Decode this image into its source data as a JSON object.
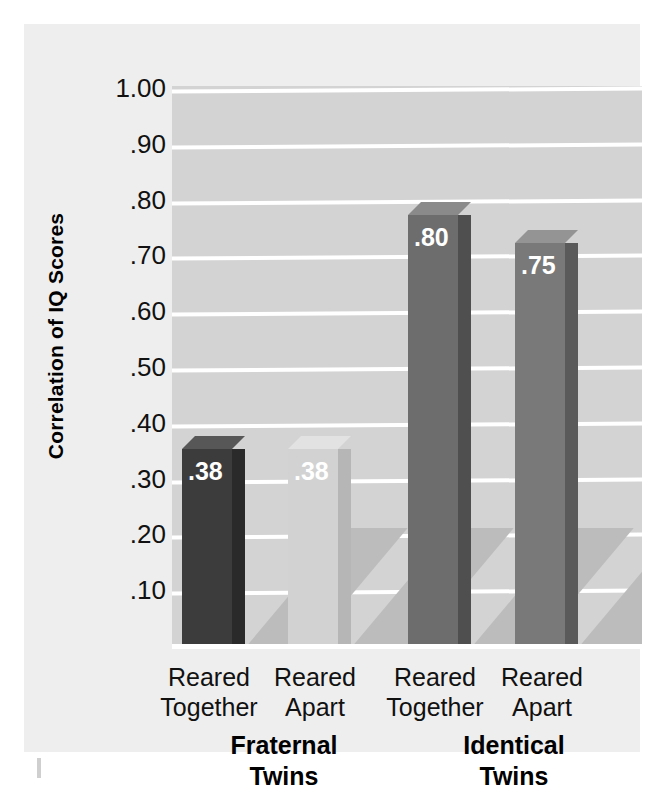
{
  "chart_data": {
    "type": "bar",
    "title": "",
    "xlabel": "",
    "ylabel": "Correlation of IQ Scores",
    "ylim": [
      0.0,
      1.05
    ],
    "grid": true,
    "legend": "none",
    "ytick_labels": [
      "1.00",
      ".90",
      ".80",
      ".70",
      ".60",
      ".50",
      ".40",
      ".30",
      ".20",
      ".10"
    ],
    "ytick_values": [
      1.0,
      0.9,
      0.8,
      0.7,
      0.6,
      0.5,
      0.4,
      0.3,
      0.2,
      0.1
    ],
    "categories": [
      "Reared Together",
      "Reared Apart",
      "Reared Together",
      "Reared Apart"
    ],
    "values": [
      0.38,
      0.38,
      0.8,
      0.75
    ],
    "data_labels": [
      ".38",
      ".38",
      ".80",
      ".75"
    ],
    "groups": [
      {
        "name": "Fraternal Twins",
        "line1": "Fraternal",
        "line2": "Twins",
        "categories": [
          "Reared Together",
          "Reared Apart"
        ],
        "values": [
          0.38,
          0.38
        ]
      },
      {
        "name": "Identical Twins",
        "line1": "Identical",
        "line2": "Twins",
        "categories": [
          "Reared Together",
          "Reared Apart"
        ],
        "values": [
          0.8,
          0.75
        ]
      }
    ],
    "bars": [
      {
        "label_line1": "Reared",
        "label_line2": "Together",
        "value": 0.38,
        "data_label": ".38",
        "color": "#3c3c3c",
        "side_color": "#2a2a2a",
        "top_color": "#575757"
      },
      {
        "label_line1": "Reared",
        "label_line2": "Apart",
        "value": 0.38,
        "data_label": ".38",
        "color": "#d2d2d2",
        "side_color": "#b6b6b6",
        "top_color": "#e2e2e2"
      },
      {
        "label_line1": "Reared",
        "label_line2": "Together",
        "value": 0.8,
        "data_label": ".80",
        "color": "#6d6d6d",
        "side_color": "#4f4f4f",
        "top_color": "#8a8a8a"
      },
      {
        "label_line1": "Reared",
        "label_line2": "Apart",
        "value": 0.75,
        "data_label": ".75",
        "color": "#797979",
        "side_color": "#5a5a5a",
        "top_color": "#949494"
      }
    ],
    "colors": {
      "plot_background": "#d3d3d3",
      "figure_background": "#eeeeee",
      "gridline": "#ffffff",
      "shadow": "#bcbcbc",
      "axis_text": "#111111"
    }
  }
}
